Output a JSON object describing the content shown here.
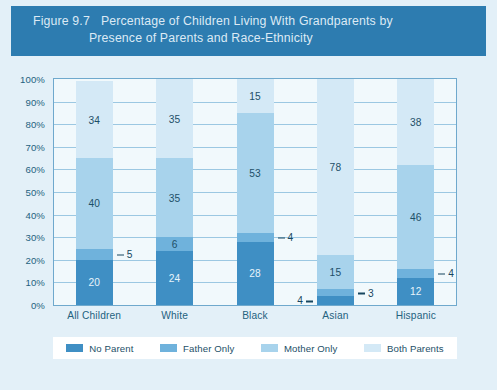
{
  "header": {
    "figure_number": "Figure 9.7",
    "title_line1": "Percentage of Children Living With Grandparents by",
    "title_line2": "Presence of Parents and Race-Ethnicity"
  },
  "colors": {
    "header_band": "#2d7cb0",
    "figure_background": "#e3f0f8",
    "plot_background": "#f1f9fc",
    "plot_border": "#6fa9cd",
    "gridline": "#9cc8e2",
    "no_parent": "#3f8fc4",
    "father_only": "#6fb2dc",
    "mother_only": "#a8d3ec",
    "both_parents": "#d4e9f6",
    "axis_text": "#24627f",
    "label_text": "#1d4f68"
  },
  "chart_data": {
    "type": "bar",
    "stacked": true,
    "title": "Percentage of Children Living With Grandparents by Presence of Parents and Race-Ethnicity",
    "xlabel": "",
    "ylabel": "",
    "ylim": [
      0,
      100
    ],
    "ytick_labels": [
      "100%",
      "90%",
      "80%",
      "70%",
      "60%",
      "50%",
      "40%",
      "30%",
      "20%",
      "10%",
      "0%"
    ],
    "ytick_values": [
      100,
      90,
      80,
      70,
      60,
      50,
      40,
      30,
      20,
      10,
      0
    ],
    "grid": true,
    "legend_position": "bottom",
    "categories": [
      "All Children",
      "White",
      "Black",
      "Asian",
      "Hispanic"
    ],
    "series": [
      {
        "name": "No Parent",
        "color": "#3f8fc4",
        "values": [
          20,
          24,
          28,
          4,
          12
        ]
      },
      {
        "name": "Father Only",
        "color": "#6fb2dc",
        "values": [
          5,
          6,
          4,
          3,
          4
        ]
      },
      {
        "name": "Mother Only",
        "color": "#a8d3ec",
        "values": [
          40,
          35,
          53,
          15,
          46
        ]
      },
      {
        "name": "Both Parents",
        "color": "#d4e9f6",
        "values": [
          34,
          35,
          15,
          78,
          38
        ]
      }
    ]
  },
  "legend": {
    "items": [
      {
        "label": "No Parent",
        "color": "#3f8fc4"
      },
      {
        "label": "Father Only",
        "color": "#6fb2dc"
      },
      {
        "label": "Mother Only",
        "color": "#a8d3ec"
      },
      {
        "label": "Both Parents",
        "color": "#d4e9f6"
      }
    ]
  }
}
